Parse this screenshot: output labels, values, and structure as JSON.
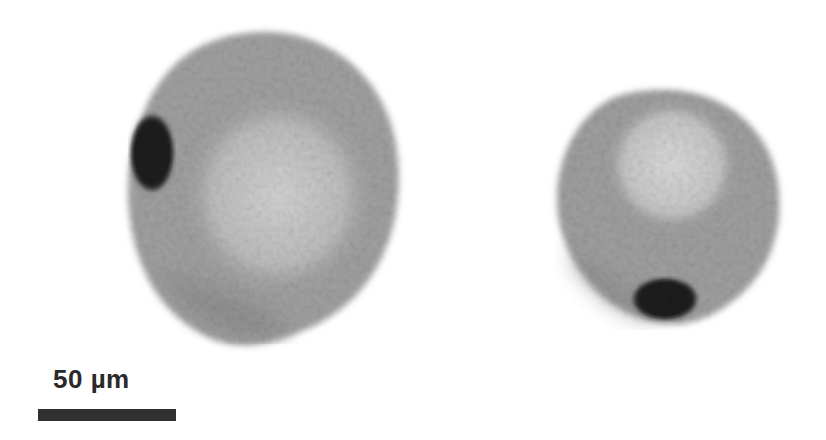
{
  "figure": {
    "scale_bar": {
      "label": "50 µm",
      "color": "#303030"
    },
    "cells": [
      {
        "name": "left-cell",
        "body_color": "#9a9a9a",
        "nucleus_color": "#1e1e1e",
        "center_color": "#c8c8c8"
      },
      {
        "name": "right-cell",
        "body_color": "#9c9c9c",
        "nucleus_color": "#1e1e1e",
        "center_color": "#cfcfcf"
      }
    ]
  }
}
